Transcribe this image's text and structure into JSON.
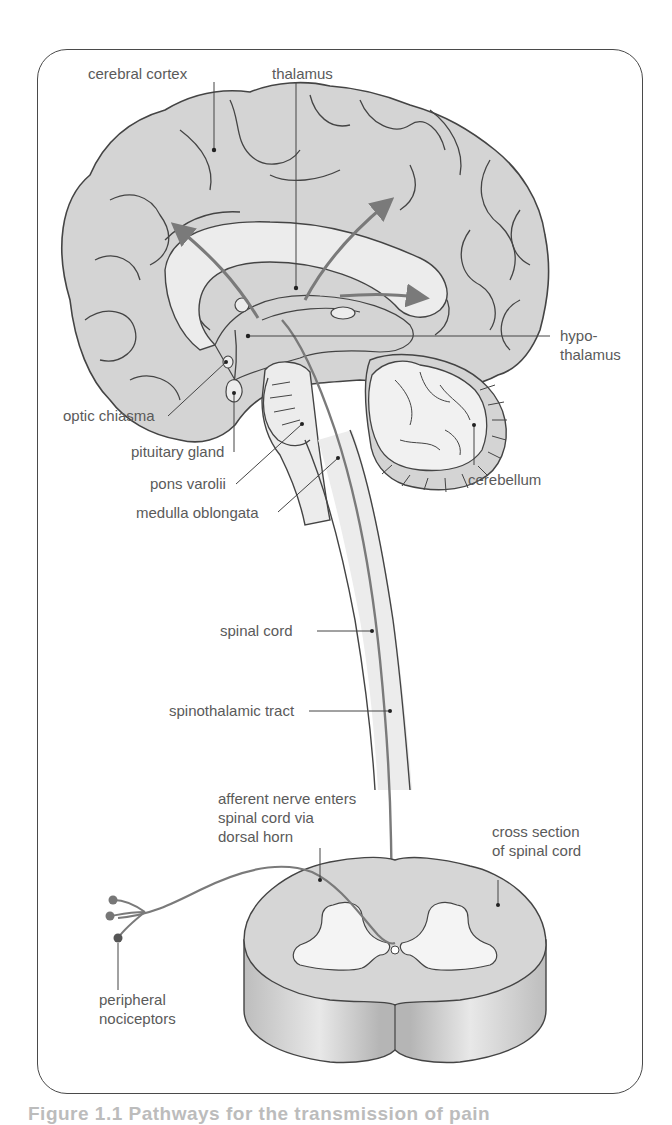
{
  "figure": {
    "caption_partial": "Figure 1.1 Pathways for the transmission of pain",
    "colors": {
      "frame": "#4a4a4a",
      "brain_fill": "#d4d4d4",
      "inner_fill": "#ececec",
      "outline": "#444444",
      "pathway": "#7a7a7a",
      "label_text": "#5a5a5a"
    }
  },
  "labels": {
    "cerebral_cortex": "cerebral cortex",
    "thalamus": "thalamus",
    "hypothalamus_line1": "hypo-",
    "hypothalamus_line2": "thalamus",
    "optic_chiasma": "optic chiasma",
    "pituitary_gland": "pituitary gland",
    "pons_varolii": "pons varolii",
    "medulla_oblongata": "medulla oblongata",
    "cerebellum": "cerebellum",
    "spinal_cord": "spinal cord",
    "spinothalamic_tract": "spinothalamic tract",
    "afferent_line1": "afferent nerve enters",
    "afferent_line2": "spinal cord via",
    "afferent_line3": "dorsal horn",
    "cross_section_line1": "cross section",
    "cross_section_line2": "of spinal cord",
    "peripheral_line1": "peripheral",
    "peripheral_line2": "nociceptors"
  }
}
